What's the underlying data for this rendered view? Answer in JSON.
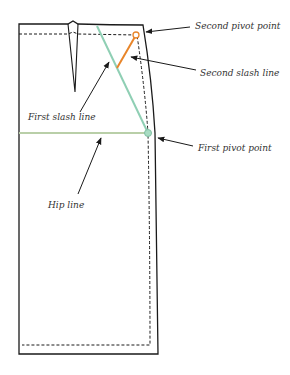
{
  "colors": {
    "outline": "#1a1a1a",
    "first_slash": "#8fcfb4",
    "second_slash": "#e8852a",
    "hip_line": "#b9cfa8",
    "pivot_first": "#8fcfb4",
    "pivot_second": "#e8852a"
  },
  "labels": {
    "second_pivot_point": "Second pivot point",
    "second_slash_line": "Second slash line",
    "first_slash_line": "First slash line",
    "first_pivot_point": "First pivot point",
    "hip_line": "Hip line"
  }
}
